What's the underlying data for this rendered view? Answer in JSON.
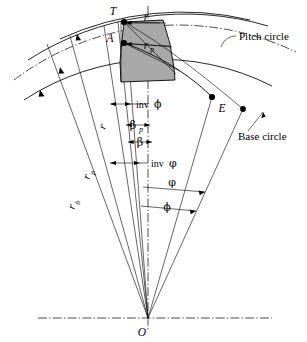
{
  "figure": {
    "background_color": "#ffffff",
    "line_color": "#000000",
    "tooth_fill_color": "#a8a8a8"
  },
  "points": {
    "tip": "T",
    "profile": "A",
    "involute_end": "E",
    "center": "O"
  },
  "radii": [
    {
      "key": "r",
      "label": "r",
      "sub": ""
    },
    {
      "key": "rp",
      "label": "r",
      "sub": "p"
    },
    {
      "key": "rb",
      "label": "r",
      "sub": "b"
    }
  ],
  "tooth_radii": [
    {
      "key": "t_r",
      "label": "r",
      "sub": ""
    },
    {
      "key": "t_rp",
      "label": "r",
      "sub": "p"
    }
  ],
  "angles": [
    {
      "key": "inv_phi",
      "prefix": "inv",
      "symbol": "ϕ"
    },
    {
      "key": "beta_p",
      "prefix": "",
      "symbol": "β",
      "sub": "p"
    },
    {
      "key": "beta",
      "prefix": "",
      "symbol": "β",
      "sub": ""
    },
    {
      "key": "inv_varphi",
      "prefix": "inv",
      "symbol": "φ"
    },
    {
      "key": "varphi",
      "prefix": "",
      "symbol": "φ"
    },
    {
      "key": "phi",
      "prefix": "",
      "symbol": "ϕ"
    }
  ],
  "annotations": {
    "pitch_circle": "Pitch circle",
    "base_circle": "Base circle"
  },
  "inv_label_text": "inv"
}
